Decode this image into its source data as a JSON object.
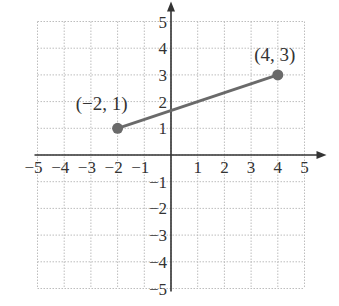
{
  "chart_data": {
    "type": "line",
    "title": "",
    "xlabel": "",
    "ylabel": "",
    "xlim": [
      -5,
      5
    ],
    "ylim": [
      -5,
      5
    ],
    "grid": true,
    "x_ticks": [
      -5,
      -4,
      -3,
      -2,
      -1,
      1,
      2,
      3,
      4,
      5
    ],
    "y_ticks": [
      -5,
      -4,
      -3,
      -2,
      -1,
      1,
      2,
      3,
      4,
      5
    ],
    "x_tick_labels": [
      "−5",
      "−4",
      "−3",
      "−2",
      "−1",
      "1",
      "2",
      "3",
      "4",
      "5"
    ],
    "y_tick_labels": [
      "−5",
      "−4",
      "−3",
      "−2",
      "−1",
      "1",
      "2",
      "3",
      "4",
      "5"
    ],
    "series": [
      {
        "name": "segment",
        "points": [
          {
            "x": -2,
            "y": 1,
            "label": "(−2, 1)"
          },
          {
            "x": 4,
            "y": 3,
            "label": "(4, 3)"
          }
        ]
      }
    ]
  },
  "colors": {
    "grid": "#bdbdbd",
    "axis": "#333333",
    "segment": "#6a6a6a",
    "point": "#6a6a6a"
  }
}
